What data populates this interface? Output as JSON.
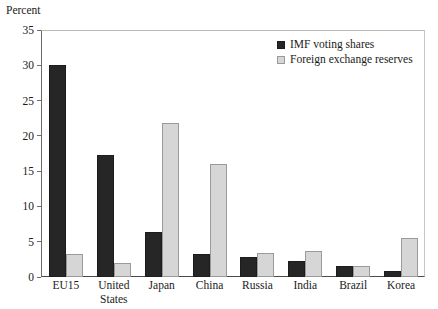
{
  "chart_data": {
    "type": "bar",
    "title": "Percent",
    "xlabel": "",
    "ylabel": "",
    "ylim": [
      0,
      35
    ],
    "yticks": [
      35,
      30,
      25,
      20,
      15,
      10,
      5,
      0
    ],
    "grid": false,
    "legend_position": "top-right",
    "categories": [
      "EU15",
      "United States",
      "Japan",
      "China",
      "Russia",
      "India",
      "Brazil",
      "Korea"
    ],
    "category_lines": [
      [
        "EU15"
      ],
      [
        "United",
        "States"
      ],
      [
        "Japan"
      ],
      [
        "China"
      ],
      [
        "Russia"
      ],
      [
        "India"
      ],
      [
        "Brazil"
      ],
      [
        "Korea"
      ]
    ],
    "series": [
      {
        "name": "IMF voting shares",
        "color": "#262626",
        "values": [
          30.0,
          17.3,
          6.4,
          3.2,
          2.9,
          2.3,
          1.5,
          0.8
        ]
      },
      {
        "name": "Foreign exchange reserves",
        "color": "#d6d6d6",
        "values": [
          3.3,
          2.0,
          21.8,
          16.0,
          3.4,
          3.7,
          1.5,
          5.5
        ]
      }
    ]
  },
  "colors": {
    "dark_series": "#262626",
    "light_series": "#d6d6d6",
    "axis": "#4a4a4a",
    "text": "#1a1a1a",
    "background": "#ffffff"
  }
}
